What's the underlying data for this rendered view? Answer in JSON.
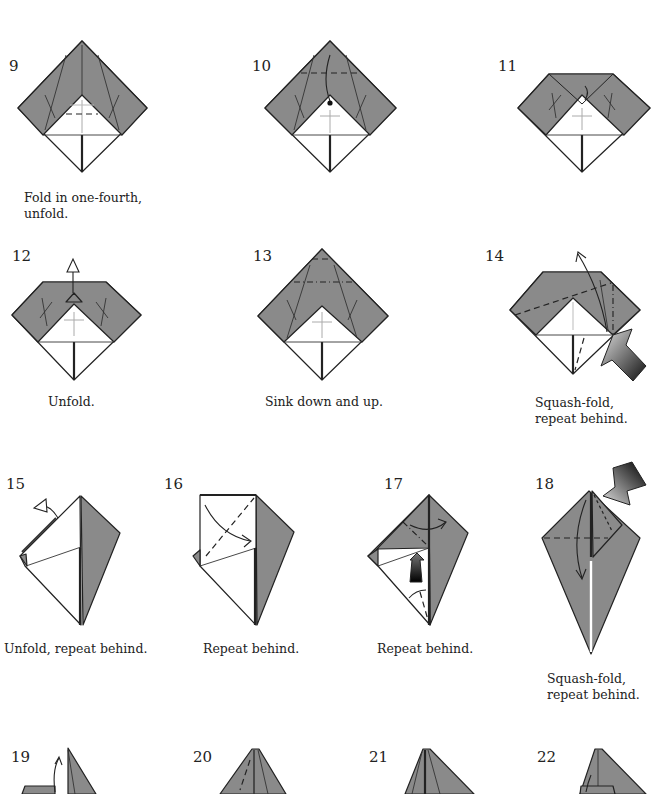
{
  "page": {
    "type": "origami instruction diagram sequence",
    "colors": {
      "paper_colored": "#8a8a8a",
      "paper_white": "#ffffff",
      "line": "#222222"
    }
  },
  "steps": [
    {
      "number": "9",
      "caption_lines": [
        "Fold in one-fourth,",
        "unfold."
      ]
    },
    {
      "number": "10",
      "caption_lines": []
    },
    {
      "number": "11",
      "caption_lines": []
    },
    {
      "number": "12",
      "caption_lines": [
        "Unfold."
      ]
    },
    {
      "number": "13",
      "caption_lines": [
        "Sink down and up."
      ]
    },
    {
      "number": "14",
      "caption_lines": [
        "Squash-fold,",
        "repeat behind."
      ]
    },
    {
      "number": "15",
      "caption_lines": [
        "Unfold, repeat behind."
      ]
    },
    {
      "number": "16",
      "caption_lines": [
        "Repeat behind."
      ]
    },
    {
      "number": "17",
      "caption_lines": [
        "Repeat behind."
      ]
    },
    {
      "number": "18",
      "caption_lines": [
        "Squash-fold,",
        "repeat behind."
      ]
    },
    {
      "number": "19",
      "caption_lines": []
    },
    {
      "number": "20",
      "caption_lines": []
    },
    {
      "number": "21",
      "caption_lines": []
    },
    {
      "number": "22",
      "caption_lines": []
    }
  ]
}
